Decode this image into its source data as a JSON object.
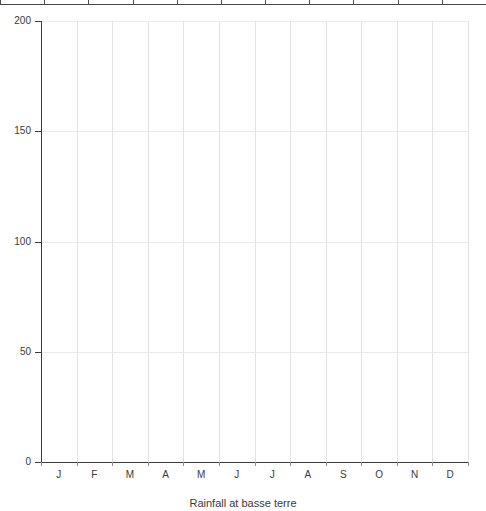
{
  "top_ruler": {
    "name": "cut-off-table-edge",
    "tick_count": 11
  },
  "chart_data": {
    "type": "bar",
    "title": "Rainfall at basse terre",
    "xlabel": "",
    "ylabel": "",
    "categories": [
      "J",
      "F",
      "M",
      "A",
      "M",
      "J",
      "J",
      "A",
      "S",
      "O",
      "N",
      "D"
    ],
    "values": [
      null,
      null,
      null,
      null,
      null,
      null,
      null,
      null,
      null,
      null,
      null,
      null
    ],
    "series": [],
    "ylim": [
      0,
      200
    ],
    "yticks": [
      0,
      50,
      100,
      150,
      200
    ],
    "ytick_labels": [
      "0",
      "50",
      "100",
      "150",
      "200"
    ],
    "grid": true,
    "grid_vertical": true,
    "grid_horizontal": true,
    "legend": "none",
    "note": "empty plot - no data series rendered"
  },
  "axis": {
    "y_labels": [
      "200",
      "150",
      "100",
      "50",
      "0"
    ],
    "x_labels": [
      "J",
      "F",
      "M",
      "A",
      "M",
      "J",
      "J",
      "A",
      "S",
      "O",
      "N",
      "D"
    ]
  },
  "colors": {
    "background": "#ffffff",
    "axis": "#3b3b3b",
    "gridline_vertical": "#e2e2e2",
    "gridline_horizontal": "#eaeaea",
    "text": "#3a3a3a",
    "rule": "#4a4a4a"
  }
}
